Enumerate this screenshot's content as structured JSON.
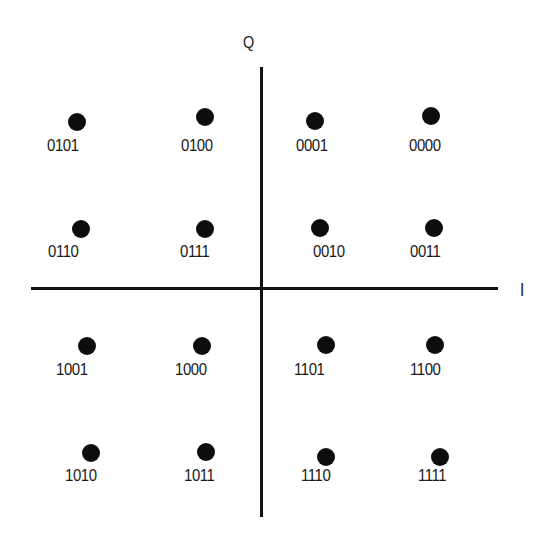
{
  "diagram": {
    "type": "16-QAM constellation",
    "axes": {
      "horizontal_label": "I",
      "vertical_label": "Q"
    },
    "points": [
      {
        "code": "0101",
        "col": 0,
        "row": 0,
        "dot": [
          77,
          122
        ],
        "label": [
          47,
          137
        ]
      },
      {
        "code": "0100",
        "col": 1,
        "row": 0,
        "dot": [
          205,
          117
        ],
        "label": [
          181,
          137
        ]
      },
      {
        "code": "0001",
        "col": 2,
        "row": 0,
        "dot": [
          315,
          121
        ],
        "label": [
          296,
          137
        ]
      },
      {
        "code": "0000",
        "col": 3,
        "row": 0,
        "dot": [
          431,
          116
        ],
        "label": [
          409,
          137
        ]
      },
      {
        "code": "0110",
        "col": 0,
        "row": 1,
        "dot": [
          81,
          229
        ],
        "label": [
          48,
          243
        ]
      },
      {
        "code": "0111",
        "col": 1,
        "row": 1,
        "dot": [
          205,
          229
        ],
        "label": [
          180,
          243
        ]
      },
      {
        "code": "0010",
        "col": 2,
        "row": 1,
        "dot": [
          320,
          228
        ],
        "label": [
          313,
          243
        ]
      },
      {
        "code": "0011",
        "col": 3,
        "row": 1,
        "dot": [
          434,
          228
        ],
        "label": [
          410,
          243
        ]
      },
      {
        "code": "1001",
        "col": 0,
        "row": 2,
        "dot": [
          87,
          346
        ],
        "label": [
          56,
          361
        ]
      },
      {
        "code": "1000",
        "col": 1,
        "row": 2,
        "dot": [
          202,
          346
        ],
        "label": [
          175,
          361
        ]
      },
      {
        "code": "1101",
        "col": 2,
        "row": 2,
        "dot": [
          326,
          345
        ],
        "label": [
          294,
          361
        ]
      },
      {
        "code": "1100",
        "col": 3,
        "row": 2,
        "dot": [
          435,
          345
        ],
        "label": [
          410,
          361
        ]
      },
      {
        "code": "1010",
        "col": 0,
        "row": 3,
        "dot": [
          91,
          453
        ],
        "label": [
          65,
          467
        ]
      },
      {
        "code": "1011",
        "col": 1,
        "row": 3,
        "dot": [
          206,
          452
        ],
        "label": [
          184,
          467
        ]
      },
      {
        "code": "1110",
        "col": 2,
        "row": 3,
        "dot": [
          326,
          457
        ],
        "label": [
          301,
          467
        ]
      },
      {
        "code": "1111",
        "col": 3,
        "row": 3,
        "dot": [
          440,
          457
        ],
        "label": [
          418,
          467
        ]
      }
    ],
    "colors": {
      "background": "#ffffff",
      "ink": "#111111"
    }
  }
}
